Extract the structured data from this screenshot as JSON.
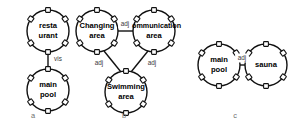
{
  "figure": {
    "panels": [
      {
        "caption": "a",
        "caption_x": 33,
        "caption_y": 116,
        "nodes": [
          {
            "id": "restaurant",
            "lines": [
              "resta",
              "urant"
            ],
            "cx": 48,
            "cy": 31,
            "r": 21,
            "ports": [
              0,
              55,
              125,
              180,
              235,
              305
            ]
          },
          {
            "id": "main-pool-a",
            "lines": [
              "main",
              "pool"
            ],
            "cx": 48,
            "cy": 90,
            "r": 21,
            "ports": [
              0,
              55,
              125,
              180,
              235,
              305
            ]
          }
        ],
        "edges": [
          {
            "label": "vis",
            "from": "restaurant",
            "to": "main-pool-a",
            "x1": 48,
            "y1": 52,
            "x2": 48,
            "y2": 69,
            "label_x": 58,
            "label_y": 59
          }
        ]
      },
      {
        "caption": "b",
        "caption_x": 124,
        "caption_y": 116,
        "nodes": [
          {
            "id": "changing-area",
            "lines": [
              "Changing",
              "area"
            ],
            "cx": 97,
            "cy": 31,
            "r": 21,
            "ports": [
              0,
              55,
              125,
              180,
              235,
              305
            ]
          },
          {
            "id": "communication-area",
            "lines": [
              "Communication",
              "area"
            ],
            "cx": 154,
            "cy": 31,
            "r": 21,
            "ports": [
              0,
              55,
              125,
              180,
              235,
              305
            ]
          },
          {
            "id": "swimming-area",
            "lines": [
              "Swimming",
              "area"
            ],
            "cx": 126,
            "cy": 92,
            "r": 21,
            "ports": [
              0,
              55,
              125,
              180,
              235,
              305
            ]
          }
        ],
        "edges": [
          {
            "label": "adj",
            "from": "changing-area",
            "to": "communication-area",
            "x1": 118,
            "y1": 31,
            "x2": 133,
            "y2": 31,
            "label_x": 125,
            "label_y": 24
          },
          {
            "label": "adj",
            "from": "changing-area",
            "to": "swimming-area",
            "x1": 104,
            "y1": 51,
            "x2": 121,
            "y2": 72,
            "label_x": 99,
            "label_y": 63
          },
          {
            "label": "adj",
            "from": "communication-area",
            "to": "swimming-area",
            "x1": 148,
            "y1": 51,
            "x2": 131,
            "y2": 72,
            "label_x": 152,
            "label_y": 63
          }
        ]
      },
      {
        "caption": "c",
        "caption_x": 235,
        "caption_y": 116,
        "nodes": [
          {
            "id": "main-pool-c",
            "lines": [
              "main",
              "pool"
            ],
            "cx": 219,
            "cy": 65,
            "r": 21,
            "ports": [
              0,
              55,
              125,
              180,
              235,
              305
            ]
          },
          {
            "id": "sauna",
            "lines": [
              "sauna"
            ],
            "cx": 266,
            "cy": 65,
            "r": 21,
            "ports": [
              0,
              55,
              125,
              180,
              235,
              305
            ]
          }
        ],
        "edges": [
          {
            "label": "adj",
            "from": "main-pool-c",
            "to": "sauna",
            "x1": 240,
            "y1": 65,
            "x2": 245,
            "y2": 65,
            "label_x": 242,
            "label_y": 58
          }
        ]
      }
    ],
    "colors": {
      "stroke": "#111111",
      "background": "#ffffff",
      "label_text": "#000000",
      "edge_label_text": "#3a3a3a",
      "caption_text": "#6e6e6e"
    }
  }
}
